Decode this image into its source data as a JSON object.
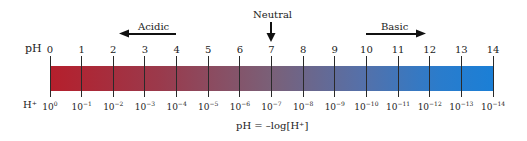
{
  "labels": {
    "ph_axis": "pH",
    "h_axis": "H⁺",
    "neutral": "Neutral",
    "acidic": "Acidic",
    "basic": "Basic",
    "formula": "pH = –log[H⁺]"
  },
  "colors": {
    "acidic_end": "#b51f2c",
    "neutral_mid": "#7a6078",
    "basic_end": "#1b7fd6"
  },
  "scale": {
    "ph_values": [
      "0",
      "1",
      "2",
      "3",
      "4",
      "5",
      "6",
      "7",
      "8",
      "9",
      "10",
      "11",
      "12",
      "13",
      "14"
    ],
    "h_base": "10",
    "h_exponents": [
      "0",
      "−1",
      "−2",
      "−3",
      "−4",
      "−5",
      "−6",
      "−7",
      "−8",
      "−9",
      "−10",
      "−11",
      "−12",
      "−13",
      "−14"
    ]
  },
  "chart_data": {
    "type": "scale",
    "x_ticks_top": [
      0,
      1,
      2,
      3,
      4,
      5,
      6,
      7,
      8,
      9,
      10,
      11,
      12,
      13,
      14
    ],
    "x_ticks_bottom": [
      "10^0",
      "10^-1",
      "10^-2",
      "10^-3",
      "10^-4",
      "10^-5",
      "10^-6",
      "10^-7",
      "10^-8",
      "10^-9",
      "10^-10",
      "10^-11",
      "10^-12",
      "10^-13",
      "10^-14"
    ],
    "annotations": [
      {
        "text": "Acidic",
        "direction": "left",
        "from": 4,
        "to": 2.4
      },
      {
        "text": "Neutral",
        "at": 7,
        "direction": "down"
      },
      {
        "text": "Basic",
        "direction": "right",
        "from": 10,
        "to": 11.8
      }
    ],
    "formula": "pH = -log[H+]",
    "gradient": [
      "red (acidic)",
      "purple-gray (neutral)",
      "blue (basic)"
    ]
  }
}
